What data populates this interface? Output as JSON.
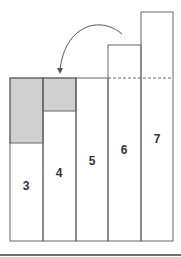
{
  "diagram": {
    "bars": [
      {
        "label": "3",
        "x": 10,
        "top": 78,
        "shaded_bottom": 143
      },
      {
        "label": "4",
        "x": 43,
        "top": 78,
        "shaded_bottom": 111
      },
      {
        "label": "5",
        "x": 76,
        "top": 78
      },
      {
        "label": "6",
        "x": 108,
        "top": 45
      },
      {
        "label": "7",
        "x": 141,
        "top": 12
      }
    ],
    "bar_width": 32.5,
    "baseline_y": 241,
    "level_y": 78,
    "colors": {
      "shade": "#d0d0d0",
      "line": "#555555"
    }
  }
}
